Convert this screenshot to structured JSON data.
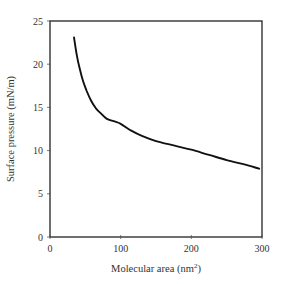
{
  "chart_data": {
    "type": "line",
    "title": "",
    "xlabel": "Molecular area (nm",
    "xlabel_sup": "2",
    "xlabel_end": ")",
    "ylabel": "Surface pressure (mN/m)",
    "xlim": [
      0,
      300
    ],
    "ylim": [
      0,
      25
    ],
    "xticks": [
      0,
      100,
      200,
      300
    ],
    "yticks": [
      0,
      5,
      10,
      15,
      20,
      25
    ],
    "xtick_labels": [
      "0",
      "100",
      "200",
      "300"
    ],
    "ytick_labels": [
      "0",
      "5",
      "10",
      "15",
      "20",
      "25"
    ],
    "grid": false,
    "legend": null,
    "series": [
      {
        "name": "isotherm",
        "color": "#111111",
        "x": [
          34,
          38,
          42,
          47,
          52,
          58,
          65,
          72,
          80,
          90,
          100,
          115,
          130,
          150,
          175,
          200,
          225,
          250,
          275,
          296
        ],
        "y": [
          23.1,
          21.0,
          19.5,
          18.0,
          16.9,
          15.8,
          14.9,
          14.3,
          13.7,
          13.4,
          13.1,
          12.3,
          11.7,
          11.1,
          10.6,
          10.1,
          9.5,
          8.9,
          8.4,
          7.9
        ]
      }
    ]
  }
}
